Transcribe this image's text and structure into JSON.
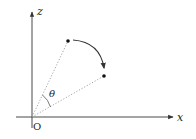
{
  "diagram": {
    "axes": {
      "vertical_label": "z",
      "horizontal_label": "x",
      "origin_label": "O"
    },
    "angle_label": "θ",
    "colors": {
      "axis": "#333333",
      "dotted_line": "#999999",
      "point": "#111111",
      "arc": "#333333"
    }
  }
}
